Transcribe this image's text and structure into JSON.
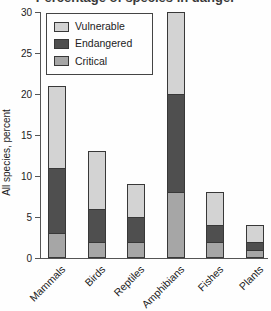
{
  "figure": {
    "title_cropped": "Percentage of species in danger",
    "y_axis": {
      "label": "All species, percent",
      "ticks": [
        0,
        5,
        10,
        15,
        20,
        25,
        30
      ]
    },
    "legend": {
      "items": [
        {
          "label": "Vulnerable",
          "color": "#d3d3d3"
        },
        {
          "label": "Endangered",
          "color": "#4f4f4f"
        },
        {
          "label": "Critical",
          "color": "#a6a6a6"
        }
      ]
    }
  },
  "chart_data": {
    "type": "bar",
    "stacked": true,
    "categories": [
      "Mammals",
      "Birds",
      "Reptiles",
      "Amphibians",
      "Fishes",
      "Plants"
    ],
    "series": [
      {
        "name": "Critical",
        "color": "#a6a6a6",
        "values": [
          3,
          2,
          2,
          8,
          2,
          1
        ]
      },
      {
        "name": "Endangered",
        "color": "#4f4f4f",
        "values": [
          8,
          4,
          3,
          12,
          2,
          1
        ]
      },
      {
        "name": "Vulnerable",
        "color": "#d3d3d3",
        "values": [
          10,
          7,
          4,
          10,
          4,
          2
        ]
      }
    ],
    "totals": [
      21,
      13,
      9,
      30,
      8,
      4
    ],
    "title": "",
    "xlabel": "",
    "ylabel": "All species, percent",
    "ylim": [
      0,
      30
    ],
    "legend_position": "upper-left",
    "grid": false
  }
}
